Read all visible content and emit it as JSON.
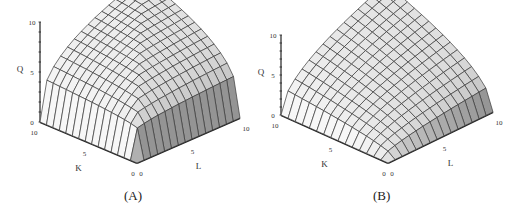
{
  "chart_data": [
    {
      "type": "surface3d",
      "panel_label": "(A)",
      "title": "",
      "axes": {
        "x": {
          "label": "K",
          "range": [
            0,
            10
          ],
          "ticks": [
            "0",
            "5",
            "10"
          ]
        },
        "y": {
          "label": "L",
          "range": [
            0,
            10
          ],
          "ticks": [
            "0",
            "5",
            "10"
          ]
        },
        "z": {
          "label": "Q",
          "range": [
            0,
            10
          ],
          "ticks": [
            "0",
            "5",
            "10"
          ]
        }
      },
      "surface_shape": "concave dome, steep rise near origin then flattening (edges rise sharply from 0)",
      "grid_lines_per_axis": 15,
      "corner_values": {
        "K0_L0": 0,
        "K10_L0": 0,
        "K0_L10": 0,
        "K10_L10": 10
      },
      "grid": false
    },
    {
      "type": "surface3d",
      "panel_label": "(B)",
      "title": "",
      "axes": {
        "x": {
          "label": "K",
          "range": [
            0,
            10
          ],
          "ticks": [
            "0",
            "5",
            "10"
          ]
        },
        "y": {
          "label": "L",
          "range": [
            0,
            10
          ],
          "ticks": [
            "0",
            "5",
            "10"
          ]
        },
        "z": {
          "label": "Q",
          "range": [
            0,
            10
          ],
          "ticks": [
            "0",
            "5",
            "10"
          ]
        }
      },
      "surface_shape": "concave surface rising more gradually from the axes toward the far corner",
      "grid_lines_per_axis": 15,
      "corner_values": {
        "K0_L0": 0,
        "K10_L0": 0,
        "K0_L10": 0,
        "K10_L10": 10
      },
      "grid": false
    }
  ],
  "panels": {
    "a": {
      "caption": "(A)",
      "q_label": "Q",
      "k_label": "K",
      "l_label": "L",
      "q_ticks": [
        "10",
        "5",
        "0"
      ],
      "k_ticks": [
        "10",
        "5",
        "0"
      ],
      "l_ticks": [
        "0",
        "5",
        "10"
      ]
    },
    "b": {
      "caption": "(B)",
      "q_label": "Q",
      "k_label": "K",
      "l_label": "L",
      "q_ticks": [
        "10",
        "5",
        "0"
      ],
      "k_ticks": [
        "10",
        "5",
        "0"
      ],
      "l_ticks": [
        "0",
        "5",
        "10"
      ]
    }
  },
  "colors": {
    "surface_light": "#f4f4f4",
    "surface_dark": "#9a9a9a",
    "mesh": "#3a3a3a",
    "axis": "#222222"
  }
}
